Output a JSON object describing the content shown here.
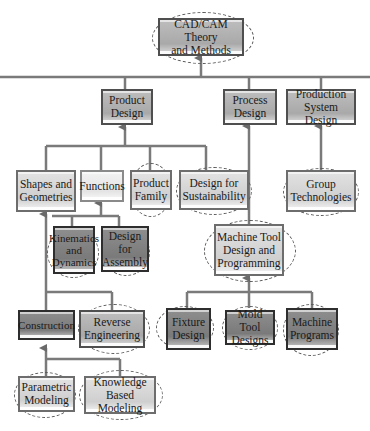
{
  "diagram": {
    "title": "CAD/CAM Theory and Methods",
    "nodes": {
      "root": "CAD/CAM Theory\nand Methods",
      "product_design": "Product\nDesign",
      "process_design": "Process\nDesign",
      "production_system_design": "Production\nSystem Design",
      "shapes_geometries": "Shapes and\nGeometries",
      "functions": "Functions",
      "product_family": "Product\nFamily",
      "design_sustainability": "Design for\nSustainability",
      "group_technologies": "Group\nTechnologies",
      "kinematics_dynamics": "Kinematics\nand\nDynamics",
      "design_assembly": "Design for\nAssembly",
      "machine_tool": "Machine Tool\nDesign and\nProgramming",
      "construction": "Construction",
      "reverse_engineering": "Reverse\nEngineering",
      "fixture_design": "Fixture\nDesign",
      "mold_tool_designs": "Mold Tool\nDesigns",
      "machine_programs": "Machine\nPrograms",
      "parametric_modeling": "Parametric\nModeling",
      "knowledge_based_modeling": "Knowledge\nBased Modeling"
    },
    "edges": [
      [
        "product_design",
        "root"
      ],
      [
        "process_design",
        "root"
      ],
      [
        "production_system_design",
        "root"
      ],
      [
        "shapes_geometries",
        "product_design"
      ],
      [
        "functions",
        "product_design"
      ],
      [
        "product_family",
        "product_design"
      ],
      [
        "design_sustainability",
        "product_design"
      ],
      [
        "machine_tool",
        "process_design"
      ],
      [
        "group_technologies",
        "production_system_design"
      ],
      [
        "kinematics_dynamics",
        "functions"
      ],
      [
        "design_assembly",
        "functions"
      ],
      [
        "construction",
        "shapes_geometries"
      ],
      [
        "reverse_engineering",
        "shapes_geometries"
      ],
      [
        "fixture_design",
        "machine_tool"
      ],
      [
        "mold_tool_designs",
        "machine_tool"
      ],
      [
        "machine_programs",
        "machine_tool"
      ],
      [
        "parametric_modeling",
        "construction"
      ],
      [
        "knowledge_based_modeling",
        "construction"
      ]
    ],
    "highlighted_with_dashed_ellipse": [
      "root",
      "product_family",
      "design_sustainability",
      "group_technologies",
      "kinematics_dynamics",
      "design_assembly",
      "machine_tool",
      "reverse_engineering",
      "fixture_design",
      "mold_tool_designs",
      "machine_programs",
      "parametric_modeling",
      "knowledge_based_modeling"
    ]
  }
}
